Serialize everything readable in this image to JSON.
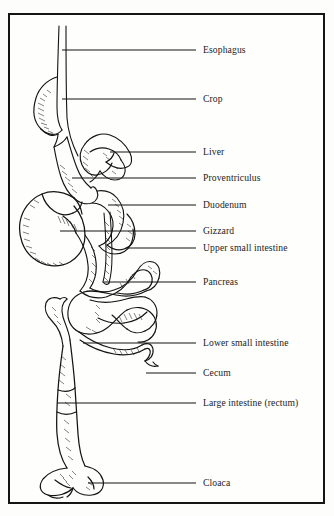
{
  "figure": {
    "frame": {
      "border_color": "#151515",
      "background": "#fefefd"
    },
    "ink_color": "#141414",
    "text_color": "#1c1c1c"
  },
  "labels": [
    {
      "id": "esophagus",
      "text": "Esophagus",
      "text_x": 203,
      "text_y": 45,
      "leader_x1": 62,
      "leader_y1": 50,
      "leader_x2": 196,
      "leader_y2": 50
    },
    {
      "id": "crop",
      "text": "Crop",
      "text_x": 203,
      "text_y": 94,
      "leader_x1": 62,
      "leader_y1": 99,
      "leader_x2": 196,
      "leader_y2": 99
    },
    {
      "id": "liver",
      "text": "Liver",
      "text_x": 203,
      "text_y": 147,
      "leader_x1": 110,
      "leader_y1": 152,
      "leader_x2": 196,
      "leader_y2": 152
    },
    {
      "id": "proventriculus",
      "text": "Proventriculus",
      "text_x": 203,
      "text_y": 173,
      "leader_x1": 72,
      "leader_y1": 178,
      "leader_x2": 196,
      "leader_y2": 178
    },
    {
      "id": "duodenum",
      "text": "Duodenum",
      "text_x": 203,
      "text_y": 200,
      "leader_x1": 108,
      "leader_y1": 205,
      "leader_x2": 196,
      "leader_y2": 205
    },
    {
      "id": "gizzard",
      "text": "Gizzard",
      "text_x": 203,
      "text_y": 226,
      "leader_x1": 60,
      "leader_y1": 231,
      "leader_x2": 196,
      "leader_y2": 231
    },
    {
      "id": "upper-small-intestine",
      "text": "Upper small intestine",
      "text_x": 203,
      "text_y": 243,
      "leader_x1": 128,
      "leader_y1": 248,
      "leader_x2": 196,
      "leader_y2": 248
    },
    {
      "id": "pancreas",
      "text": "Pancreas",
      "text_x": 203,
      "text_y": 277,
      "leader_x1": 104,
      "leader_y1": 282,
      "leader_x2": 196,
      "leader_y2": 282
    },
    {
      "id": "lower-small-intestine",
      "text": "Lower small intestine",
      "text_x": 203,
      "text_y": 338,
      "leader_x1": 83,
      "leader_y1": 343,
      "leader_x2": 196,
      "leader_y2": 343
    },
    {
      "id": "cecum",
      "text": "Cecum",
      "text_x": 203,
      "text_y": 368,
      "leader_x1": 146,
      "leader_y1": 373,
      "leader_x2": 196,
      "leader_y2": 373
    },
    {
      "id": "large-intestine",
      "text": "Large intestine (rectum)",
      "text_x": 203,
      "text_y": 398,
      "leader_x1": 57,
      "leader_y1": 403,
      "leader_x2": 196,
      "leader_y2": 403
    },
    {
      "id": "cloaca",
      "text": "Cloaca",
      "text_x": 203,
      "text_y": 478,
      "leader_x1": 88,
      "leader_y1": 483,
      "leader_x2": 196,
      "leader_y2": 483
    }
  ]
}
